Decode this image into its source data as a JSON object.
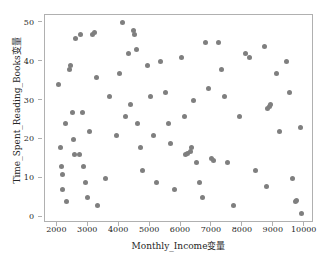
{
  "chart_data": {
    "type": "scatter",
    "title": "",
    "xlabel": "Monthly_Income变量",
    "ylabel": "Time_Spent_Reading_Books变量",
    "xlim": [
      1600,
      10300
    ],
    "ylim": [
      -1.5,
      52
    ],
    "xticks": [
      2000,
      3000,
      4000,
      5000,
      6000,
      7000,
      8000,
      9000,
      10000
    ],
    "xtick_labels": [
      "2000",
      "3000",
      "4000",
      "5000",
      "6000",
      "7000",
      "8000",
      "9000",
      "10000"
    ],
    "yticks": [
      0,
      10,
      20,
      30,
      40,
      50
    ],
    "ytick_labels": [
      "0",
      "10",
      "20",
      "30",
      "40",
      "50"
    ],
    "grid": false,
    "legend": null,
    "marker_color": "#7f7f7f",
    "marker_size": 5,
    "frame_color": "#b0b0b0",
    "points": [
      [
        2050,
        34
      ],
      [
        2100,
        18
      ],
      [
        2120,
        13
      ],
      [
        2150,
        11
      ],
      [
        2180,
        7
      ],
      [
        2250,
        24
      ],
      [
        2300,
        4
      ],
      [
        2400,
        38
      ],
      [
        2430,
        39
      ],
      [
        2500,
        27
      ],
      [
        2520,
        20
      ],
      [
        2560,
        16
      ],
      [
        2600,
        46
      ],
      [
        2700,
        16
      ],
      [
        2760,
        47
      ],
      [
        2800,
        27
      ],
      [
        2850,
        13
      ],
      [
        2900,
        9
      ],
      [
        2980,
        5
      ],
      [
        3050,
        22
      ],
      [
        3150,
        47
      ],
      [
        3200,
        47.5
      ],
      [
        3250,
        36
      ],
      [
        3300,
        3
      ],
      [
        3550,
        10
      ],
      [
        3700,
        31
      ],
      [
        3900,
        21
      ],
      [
        4000,
        37
      ],
      [
        4100,
        50
      ],
      [
        4200,
        26
      ],
      [
        4300,
        42
      ],
      [
        4350,
        29
      ],
      [
        4450,
        48
      ],
      [
        4500,
        47
      ],
      [
        4550,
        43
      ],
      [
        4600,
        24
      ],
      [
        4700,
        18
      ],
      [
        4750,
        12
      ],
      [
        4900,
        39
      ],
      [
        5000,
        31
      ],
      [
        5100,
        21
      ],
      [
        5200,
        9
      ],
      [
        5350,
        40
      ],
      [
        5500,
        32
      ],
      [
        5600,
        24
      ],
      [
        5650,
        19
      ],
      [
        5800,
        7
      ],
      [
        6000,
        41
      ],
      [
        6100,
        26
      ],
      [
        6150,
        16
      ],
      [
        6200,
        16.5
      ],
      [
        6300,
        17
      ],
      [
        6350,
        18
      ],
      [
        6400,
        30
      ],
      [
        6500,
        14
      ],
      [
        6600,
        9
      ],
      [
        6700,
        5
      ],
      [
        6800,
        45
      ],
      [
        6900,
        33
      ],
      [
        7000,
        15
      ],
      [
        7050,
        14.5
      ],
      [
        7200,
        45
      ],
      [
        7300,
        38
      ],
      [
        7400,
        31
      ],
      [
        7500,
        14
      ],
      [
        7700,
        3
      ],
      [
        7900,
        26
      ],
      [
        8100,
        42
      ],
      [
        8200,
        41
      ],
      [
        8400,
        12
      ],
      [
        8700,
        44
      ],
      [
        8750,
        8
      ],
      [
        8800,
        28
      ],
      [
        8850,
        28.5
      ],
      [
        8900,
        29
      ],
      [
        9100,
        37
      ],
      [
        9200,
        22
      ],
      [
        9400,
        40
      ],
      [
        9500,
        32
      ],
      [
        9600,
        10
      ],
      [
        9700,
        4
      ],
      [
        9750,
        4.2
      ],
      [
        9850,
        23
      ],
      [
        9900,
        1
      ]
    ]
  }
}
